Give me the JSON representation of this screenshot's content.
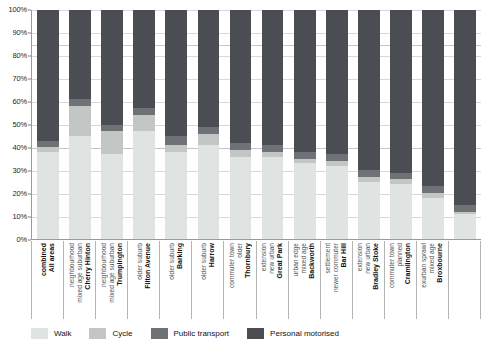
{
  "chart_data": {
    "type": "bar",
    "subtype": "stacked-bar-100",
    "title": "",
    "xlabel": "",
    "ylabel": "",
    "ylim": [
      0,
      100
    ],
    "ytick_labels": [
      "0%",
      "10%",
      "20%",
      "30%",
      "40%",
      "50%",
      "60%",
      "70%",
      "80%",
      "90%",
      "100%"
    ],
    "ytick_values": [
      0,
      10,
      20,
      30,
      40,
      50,
      60,
      70,
      80,
      90,
      100
    ],
    "grid": true,
    "legend_position": "bottom",
    "stack_order_bottom_to_top": [
      "Walk",
      "Cycle",
      "Public transport",
      "Personal motorised"
    ],
    "series": [
      {
        "name": "Walk",
        "color": "#dfe3e2",
        "values": [
          38,
          45,
          37,
          47,
          38,
          41,
          36,
          36,
          33,
          32,
          25,
          24,
          18,
          11
        ]
      },
      {
        "name": "Cycle",
        "color": "#c2c7c6",
        "values": [
          2,
          13,
          10,
          7,
          3,
          5,
          3,
          2,
          2,
          2,
          2,
          2,
          2,
          1
        ]
      },
      {
        "name": "Public transport",
        "color": "#6e7277",
        "values": [
          3,
          3,
          3,
          3,
          4,
          3,
          3,
          3,
          3,
          3,
          3,
          3,
          3,
          3
        ]
      },
      {
        "name": "Personal motorised",
        "color": "#4a4d52",
        "values": [
          57,
          39,
          50,
          43,
          55,
          51,
          58,
          59,
          62,
          63,
          70,
          71,
          77,
          85
        ]
      }
    ],
    "categories": [
      {
        "title": "All areas",
        "title2": "combined",
        "sub1": "",
        "sub2": ""
      },
      {
        "title": "Cherry Hinton",
        "title2": "",
        "sub1": "mixed age suburban",
        "sub2": "neighbourhood"
      },
      {
        "title": "Trumpington",
        "title2": "",
        "sub1": "mixed age suburban",
        "sub2": "neighbourhood"
      },
      {
        "title": "Filton Avenue",
        "title2": "",
        "sub1": "older suburb",
        "sub2": ""
      },
      {
        "title": "Barking",
        "title2": "",
        "sub1": "older suburb",
        "sub2": ""
      },
      {
        "title": "Harrow",
        "title2": "",
        "sub1": "older suburb",
        "sub2": ""
      },
      {
        "title": "Thornbury",
        "title2": "",
        "sub1": "older",
        "sub2": "commuter town"
      },
      {
        "title": "Great Park",
        "title2": "",
        "sub1": "new urban",
        "sub2": "extension"
      },
      {
        "title": "Backworth",
        "title2": "",
        "sub1": "mixed age",
        "sub2": "urban edge"
      },
      {
        "title": "Bar Hill",
        "title2": "",
        "sub1": "newer commuter",
        "sub2": "settlement"
      },
      {
        "title": "Bradley Stoke",
        "title2": "",
        "sub1": "new urban",
        "sub2": "extension"
      },
      {
        "title": "Cramlington",
        "title2": "",
        "sub1": "planned",
        "sub2": "commuter town"
      },
      {
        "title": "Broxbourne",
        "title2": "",
        "sub1": "mixed age",
        "sub2": "exurban sprawl"
      },
      {
        "title": "",
        "title2": "",
        "sub1": "",
        "sub2": ""
      }
    ]
  },
  "legend": {
    "items": [
      {
        "label": "Walk",
        "color": "#dfe3e2"
      },
      {
        "label": "Cycle",
        "color": "#c2c7c6"
      },
      {
        "label": "Public transport",
        "color": "#6e7277"
      },
      {
        "label": "Personal motorised",
        "color": "#4a4d52"
      }
    ]
  }
}
